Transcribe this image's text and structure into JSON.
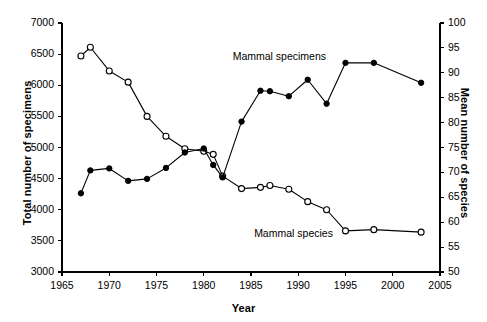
{
  "chart_data": {
    "type": "line",
    "title": "",
    "xlabel": "Year",
    "ylabel": "Total number of specimens",
    "ylabel_right": "Mean number of species",
    "xlim": [
      1965,
      2005
    ],
    "xticks": [
      1965,
      1970,
      1975,
      1980,
      1985,
      1990,
      1995,
      2000,
      2005
    ],
    "ylim": [
      3000,
      7000
    ],
    "yticks": [
      3000,
      3500,
      4000,
      4500,
      5000,
      5500,
      6000,
      6500,
      7000
    ],
    "ylim_right": [
      50,
      100
    ],
    "yticks_right": [
      50,
      55,
      60,
      65,
      70,
      75,
      80,
      85,
      90,
      95,
      100
    ],
    "grid": false,
    "legend_position": "inline-annotation",
    "series": [
      {
        "name": "Mammal specimens",
        "axis": "left",
        "marker": "open-circle",
        "marker_fill": "#ffffff",
        "color": "#000000",
        "annotation": "Mammal specimens",
        "x": [
          1967,
          1968,
          1970,
          1972,
          1974,
          1976,
          1978,
          1980,
          1981,
          1982,
          1984,
          1986,
          1987,
          1989,
          1991,
          1993,
          1995,
          1998,
          2003
        ],
        "values": [
          6470,
          6610,
          6230,
          6050,
          5500,
          5180,
          4980,
          4940,
          4890,
          4540,
          4340,
          4360,
          4390,
          4330,
          4130,
          4000,
          3660,
          3680,
          3640
        ]
      },
      {
        "name": "Mammal species",
        "axis": "right",
        "marker": "filled-circle",
        "marker_fill": "#000000",
        "color": "#000000",
        "annotation": "Mammal species",
        "x": [
          1967,
          1968,
          1970,
          1972,
          1974,
          1976,
          1978,
          1980,
          1981,
          1982,
          1984,
          1986,
          1987,
          1989,
          1991,
          1993,
          1995,
          1998,
          2003
        ],
        "values": [
          65.8,
          70.4,
          70.8,
          68.3,
          68.7,
          70.9,
          74.0,
          74.8,
          71.5,
          69.0,
          80.2,
          86.4,
          86.3,
          85.3,
          88.6,
          83.8,
          92.0,
          92.0,
          88.0
        ]
      }
    ],
    "annotations": [
      {
        "text": "Mammal specimens",
        "x": 1988.0,
        "y_right": 92.5
      },
      {
        "text": "Mammal species",
        "x": 1989.5,
        "y_right": 57.0
      }
    ]
  },
  "axes": {
    "x_tick_labels": [
      "1965",
      "1970",
      "1975",
      "1980",
      "1985",
      "1990",
      "1995",
      "2000",
      "2005"
    ],
    "y_left_tick_labels": [
      "3000",
      "3500",
      "4000",
      "4500",
      "5000",
      "5500",
      "6000",
      "6500",
      "7000"
    ],
    "y_right_tick_labels": [
      "50",
      "55",
      "60",
      "65",
      "70",
      "75",
      "80",
      "85",
      "90",
      "95",
      "100"
    ],
    "x_title": "Year",
    "y_left_title": "Total number of specimens",
    "y_right_title": "Mean number of species"
  },
  "colors": {
    "axis": "#000000",
    "line": "#000000",
    "marker_open_fill": "#ffffff",
    "marker_filled": "#000000",
    "background": "#ffffff"
  }
}
